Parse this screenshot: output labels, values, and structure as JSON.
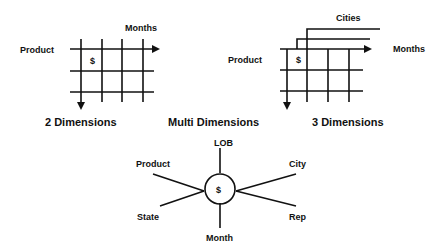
{
  "colors": {
    "ink": "#111111",
    "background": "#ffffff"
  },
  "two_d": {
    "title": "2 Dimensions",
    "row_axis": "Product",
    "col_axis": "Months",
    "cell_value": "$"
  },
  "three_d": {
    "title": "3 Dimensions",
    "row_axis": "Product",
    "col_axis": "Months",
    "depth_axis": "Cities",
    "cell_value": "$"
  },
  "multi": {
    "title": "Multi Dimensions",
    "center": "$",
    "spokes": {
      "top": "LOB",
      "upper_left": "Product",
      "upper_right": "City",
      "lower_left": "State",
      "lower_right": "Rep",
      "bottom": "Month"
    }
  }
}
